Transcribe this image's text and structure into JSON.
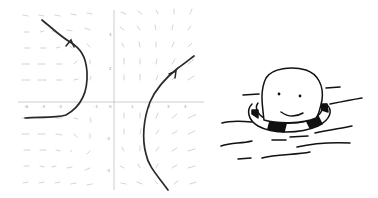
{
  "figure": {
    "left_panel": {
      "type": "phase-portrait",
      "x_tick_labels": [
        "-6",
        "-4",
        "-2",
        "-1",
        "0",
        "1",
        "2",
        "3",
        "4"
      ],
      "y_tick_labels": [
        "4",
        "2",
        "-2",
        "-4"
      ],
      "vector_field_color": "#c8c8c8",
      "axis_color": "#b8b8b8",
      "trajectory_color": "#2a2a2a",
      "trajectories": [
        {
          "name": "left-trajectory",
          "direction": "upward-left"
        },
        {
          "name": "right-trajectory",
          "direction": "upward-right"
        }
      ]
    },
    "right_panel": {
      "type": "cartoon",
      "subject": "smiling blob floating in a life ring on wavy water",
      "ink_color": "#111111"
    }
  }
}
